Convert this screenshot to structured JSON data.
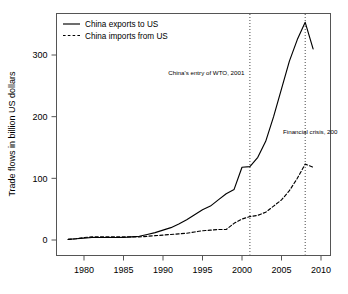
{
  "chart_data": {
    "type": "line",
    "title": "",
    "xlabel": "",
    "ylabel": "Trade flows in billion US dollars",
    "xlim": [
      1978,
      2010
    ],
    "ylim": [
      -8,
      372
    ],
    "grid": false,
    "legend_position": "top-left",
    "x_ticks": [
      "1980",
      "1985",
      "1990",
      "1995",
      "2000",
      "2005",
      "2010"
    ],
    "x_tick_values": [
      1980,
      1985,
      1990,
      1995,
      2000,
      2005,
      2010
    ],
    "y_ticks": [
      "0",
      "100",
      "200",
      "300"
    ],
    "y_tick_values": [
      0,
      100,
      200,
      300
    ],
    "x": [
      1978,
      1979,
      1980,
      1981,
      1982,
      1983,
      1984,
      1985,
      1986,
      1987,
      1988,
      1989,
      1990,
      1991,
      1992,
      1993,
      1994,
      1995,
      1996,
      1997,
      1998,
      1999,
      2000,
      2001,
      2002,
      2003,
      2004,
      2005,
      2006,
      2007,
      2008,
      2009
    ],
    "series": [
      {
        "name": "China exports to US",
        "style": "solid",
        "color": "#000000",
        "values": [
          1,
          2,
          3,
          4,
          4,
          4,
          4,
          4,
          5,
          6,
          9,
          12,
          16,
          20,
          26,
          33,
          41,
          49,
          55,
          65,
          75,
          82,
          118,
          119,
          134,
          160,
          200,
          245,
          290,
          325,
          353,
          310
        ]
      },
      {
        "name": "China imports from US",
        "style": "dashed",
        "color": "#000000",
        "values": [
          1,
          2,
          4,
          5,
          5,
          5,
          5,
          5,
          5,
          5,
          6,
          7,
          8,
          9,
          10,
          11,
          13,
          15,
          16,
          17,
          17,
          27,
          34,
          38,
          40,
          45,
          55,
          65,
          80,
          100,
          123,
          118
        ]
      }
    ],
    "annotations": [
      {
        "label": "China's entry of WTO, 2001",
        "x": 2001,
        "marker": "vertical-dotted-line",
        "text_anchor": "end",
        "text_x": 2000.3,
        "text_y": 268
      },
      {
        "label": "Financial crisis, 200",
        "x": 2008,
        "marker": "vertical-dotted-line",
        "text_anchor": "start",
        "text_x": 2005.2,
        "text_y": 172
      }
    ]
  }
}
